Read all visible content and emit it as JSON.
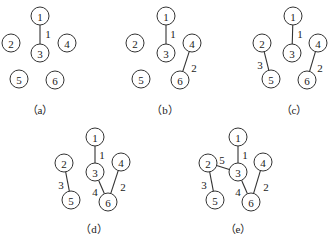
{
  "node_radius": 9,
  "panels": [
    {
      "id": "a",
      "caption": "（a）",
      "caption_pos": [
        40,
        110
      ],
      "nodes": [
        {
          "id": "1",
          "label": "1",
          "x": 40,
          "y": 16
        },
        {
          "id": "2",
          "label": "2",
          "x": 11,
          "y": 43
        },
        {
          "id": "3",
          "label": "3",
          "x": 40,
          "y": 53
        },
        {
          "id": "4",
          "label": "4",
          "x": 67,
          "y": 43
        },
        {
          "id": "5",
          "label": "5",
          "x": 19,
          "y": 79
        },
        {
          "id": "6",
          "label": "6",
          "x": 55,
          "y": 80
        }
      ],
      "edges": [
        {
          "from": "1",
          "to": "3",
          "weight": "1",
          "lx": 48,
          "ly": 34
        }
      ]
    },
    {
      "id": "b",
      "caption": "（b）",
      "caption_pos": [
        165,
        110
      ],
      "nodes": [
        {
          "id": "1",
          "label": "1",
          "x": 166,
          "y": 16
        },
        {
          "id": "2",
          "label": "2",
          "x": 135,
          "y": 43
        },
        {
          "id": "3",
          "label": "3",
          "x": 166,
          "y": 53
        },
        {
          "id": "4",
          "label": "4",
          "x": 192,
          "y": 43
        },
        {
          "id": "5",
          "label": "5",
          "x": 141,
          "y": 79
        },
        {
          "id": "6",
          "label": "6",
          "x": 180,
          "y": 80
        }
      ],
      "edges": [
        {
          "from": "1",
          "to": "3",
          "weight": "1",
          "lx": 173,
          "ly": 34
        },
        {
          "from": "4",
          "to": "6",
          "weight": "2",
          "lx": 194,
          "ly": 68
        }
      ]
    },
    {
      "id": "c",
      "caption": "（c）",
      "caption_pos": [
        294,
        110
      ],
      "nodes": [
        {
          "id": "1",
          "label": "1",
          "x": 293,
          "y": 16
        },
        {
          "id": "2",
          "label": "2",
          "x": 262,
          "y": 43
        },
        {
          "id": "3",
          "label": "3",
          "x": 292,
          "y": 53
        },
        {
          "id": "4",
          "label": "4",
          "x": 318,
          "y": 43
        },
        {
          "id": "5",
          "label": "5",
          "x": 271,
          "y": 79
        },
        {
          "id": "6",
          "label": "6",
          "x": 307,
          "y": 80
        }
      ],
      "edges": [
        {
          "from": "1",
          "to": "3",
          "weight": "1",
          "lx": 300,
          "ly": 34
        },
        {
          "from": "4",
          "to": "6",
          "weight": "2",
          "lx": 320,
          "ly": 68
        },
        {
          "from": "2",
          "to": "5",
          "weight": "3",
          "lx": 260,
          "ly": 65
        }
      ]
    },
    {
      "id": "d",
      "caption": "（d）",
      "caption_pos": [
        94,
        229
      ],
      "nodes": [
        {
          "id": "1",
          "label": "1",
          "x": 95,
          "y": 137
        },
        {
          "id": "2",
          "label": "2",
          "x": 64,
          "y": 163
        },
        {
          "id": "3",
          "label": "3",
          "x": 95,
          "y": 172
        },
        {
          "id": "4",
          "label": "4",
          "x": 121,
          "y": 162
        },
        {
          "id": "5",
          "label": "5",
          "x": 71,
          "y": 200
        },
        {
          "id": "6",
          "label": "6",
          "x": 108,
          "y": 202
        }
      ],
      "edges": [
        {
          "from": "1",
          "to": "3",
          "weight": "1",
          "lx": 102,
          "ly": 155
        },
        {
          "from": "4",
          "to": "6",
          "weight": "2",
          "lx": 123,
          "ly": 187
        },
        {
          "from": "2",
          "to": "5",
          "weight": "3",
          "lx": 61,
          "ly": 185
        },
        {
          "from": "3",
          "to": "6",
          "weight": "4",
          "lx": 95,
          "ly": 192
        }
      ]
    },
    {
      "id": "e",
      "caption": "（e）",
      "caption_pos": [
        238,
        229
      ],
      "nodes": [
        {
          "id": "1",
          "label": "1",
          "x": 238,
          "y": 137
        },
        {
          "id": "2",
          "label": "2",
          "x": 208,
          "y": 163
        },
        {
          "id": "3",
          "label": "3",
          "x": 238,
          "y": 172
        },
        {
          "id": "4",
          "label": "4",
          "x": 263,
          "y": 162
        },
        {
          "id": "5",
          "label": "5",
          "x": 215,
          "y": 200
        },
        {
          "id": "6",
          "label": "6",
          "x": 251,
          "y": 202
        }
      ],
      "edges": [
        {
          "from": "1",
          "to": "3",
          "weight": "1",
          "lx": 245,
          "ly": 155
        },
        {
          "from": "4",
          "to": "6",
          "weight": "2",
          "lx": 266,
          "ly": 187
        },
        {
          "from": "2",
          "to": "5",
          "weight": "3",
          "lx": 204,
          "ly": 185
        },
        {
          "from": "3",
          "to": "6",
          "weight": "4",
          "lx": 238,
          "ly": 192
        },
        {
          "from": "2",
          "to": "3",
          "weight": "5",
          "lx": 222,
          "ly": 160
        }
      ]
    }
  ]
}
